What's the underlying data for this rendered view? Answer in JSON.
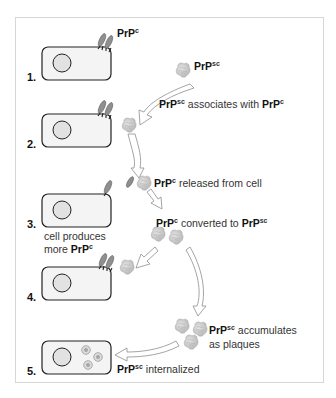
{
  "diagram": {
    "colors": {
      "cell_outline": "#222222",
      "cell_fill": "#f4f4f4",
      "prpc_fill": "#8a8a8a",
      "prpsc_fill": "#cfcfcf",
      "arrow_stroke": "#9a9a9a",
      "frame_border": "#d6d6d6"
    },
    "steps": [
      {
        "number": "1."
      },
      {
        "number": "2."
      },
      {
        "number": "3."
      },
      {
        "number": "4."
      },
      {
        "number": "5."
      }
    ],
    "labels": {
      "prpc_top": {
        "base": "PrP",
        "sup": "c"
      },
      "prpsc_top": {
        "base": "PrP",
        "sup": "sc"
      },
      "associates": {
        "a_base": "PrP",
        "a_sup": "sc",
        "mid": " associates with ",
        "b_base": "PrP",
        "b_sup": "c"
      },
      "released": {
        "base": "PrP",
        "sup": "c",
        "text": " released from cell"
      },
      "produces": {
        "line1": "cell produces",
        "line2_pre": "more ",
        "base": "PrP",
        "sup": "c"
      },
      "converted": {
        "a_base": "PrP",
        "a_sup": "c",
        "mid": " converted to ",
        "b_base": "PrP",
        "b_sup": "sc"
      },
      "accumulates": {
        "base": "PrP",
        "sup": "sc",
        "text": " accumulates",
        "line2": "as plaques"
      },
      "internalized": {
        "base": "PrP",
        "sup": "sc",
        "text": " internalized"
      }
    }
  }
}
